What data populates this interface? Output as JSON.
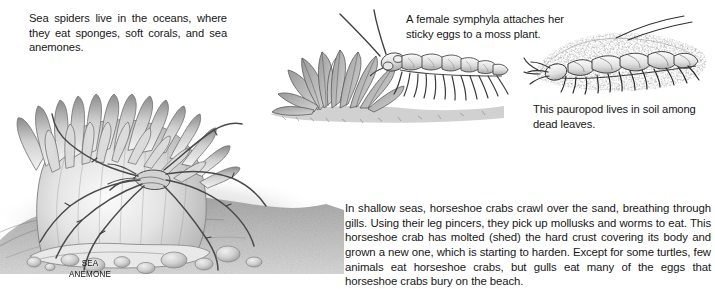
{
  "page": {
    "background_color": "#ffffff",
    "text_color": "#171717",
    "kind": "scanned-book-page-arthropods"
  },
  "captions": {
    "sea_spiders": "Sea spiders live in the oceans, where they eat sponges, soft corals, and sea anemones.",
    "symphyla": "A female symphyla attaches her sticky eggs to a moss plant.",
    "pauropod": "This pauropod lives in soil among dead leaves.",
    "horseshoe_crab": "In shallow seas, horseshoe crabs crawl over the sand, breathing through gills. Using their leg pincers, they pick up mollusks and worms to eat. This horseshoe crab has molted (shed) the hard crust covering its body and grown a new one, which is starting to harden. Except for some turtles, few animals eat horseshoe crabs, but gulls eat many of the eggs that horseshoe crabs bury on the beach."
  },
  "labels": {
    "sea_anemone": "SEA\nANEMONE"
  },
  "illustrations": [
    {
      "name": "sea-anemone-with-sea-spider",
      "subjects": [
        "sea anemone",
        "sea spider",
        "sea floor pebbles"
      ],
      "style": "graphite pencil shading, grayscale"
    },
    {
      "name": "symphyla-on-moss-plant",
      "subjects": [
        "symphyla",
        "moss plant",
        "soil"
      ],
      "style": "pen and ink line drawing with stipple"
    },
    {
      "name": "pauropod-in-leaf-litter",
      "subjects": [
        "pauropod",
        "soil",
        "dead leaves"
      ],
      "style": "pen and ink line drawing with stipple"
    }
  ]
}
